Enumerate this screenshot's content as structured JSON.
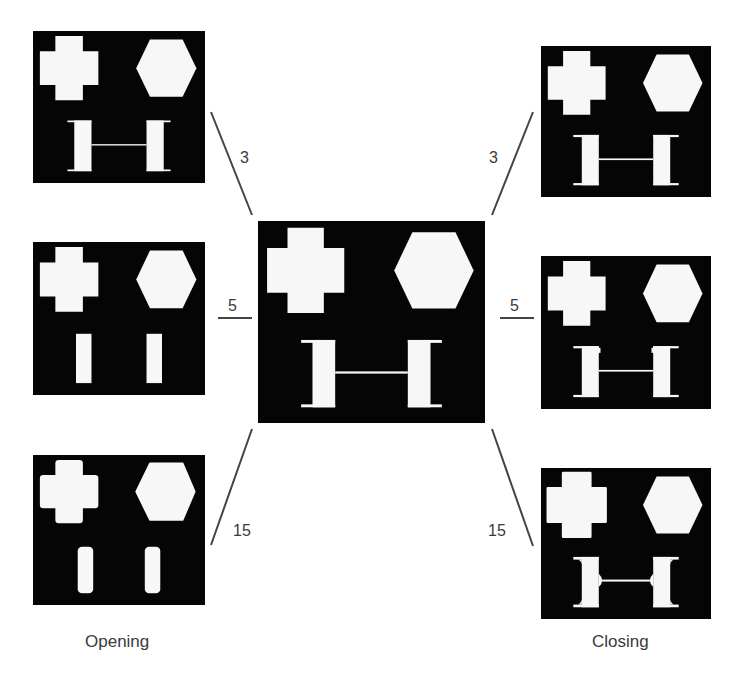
{
  "caption_fragment": "... (cropped caption text — only descenders visible) ...",
  "center_panel": {
    "name": "original",
    "shapes": [
      "cross",
      "hexagon",
      "h-beam"
    ]
  },
  "opening": {
    "label": "Opening",
    "panels": [
      {
        "size_label": "3",
        "variant": "open-3"
      },
      {
        "size_label": "5",
        "variant": "open-5"
      },
      {
        "size_label": "15",
        "variant": "open-15"
      }
    ]
  },
  "closing": {
    "label": "Closing",
    "panels": [
      {
        "size_label": "3",
        "variant": "close-3"
      },
      {
        "size_label": "5",
        "variant": "close-5"
      },
      {
        "size_label": "15",
        "variant": "close-15"
      }
    ]
  },
  "colors": {
    "panel_bg": "#050505",
    "shape_fill": "#f7f7f7",
    "line": "#444444",
    "text": "#3a3a3a"
  }
}
